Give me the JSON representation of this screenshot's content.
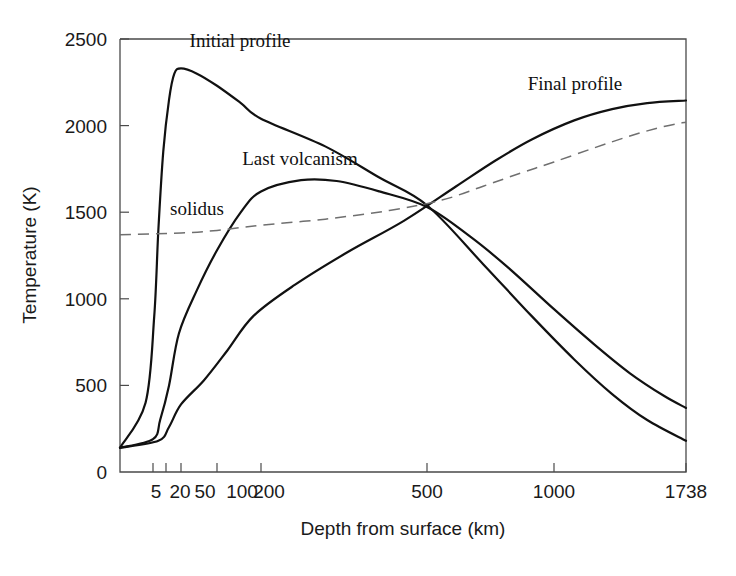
{
  "chart_data": {
    "type": "line",
    "title": "",
    "xlabel": "Depth from surface (km)",
    "ylabel": "Temperature (K)",
    "x_scale": "nonlinear-depth",
    "xlim": [
      0,
      1738
    ],
    "ylim": [
      0,
      2500
    ],
    "grid": false,
    "legend": "inline-annotations",
    "xticks": [
      5,
      20,
      50,
      100,
      200,
      500,
      1000,
      1738
    ],
    "xtick_labels": [
      "5",
      "20",
      "50",
      "100",
      "200",
      "500",
      "1000",
      "1738"
    ],
    "yticks": [
      0,
      500,
      1000,
      1500,
      2000,
      2500
    ],
    "ytick_labels": [
      "0",
      "500",
      "1000",
      "1500",
      "2000",
      "2500"
    ],
    "annotations": [
      {
        "text": "Initial profile",
        "x_px": 240,
        "y_px": 47
      },
      {
        "text": "Last volcanism",
        "x_px": 300,
        "y_px": 165
      },
      {
        "text": "solidus",
        "x_px": 197,
        "y_px": 215
      },
      {
        "text": "Final profile",
        "x_px": 575,
        "y_px": 90
      }
    ],
    "series": [
      {
        "name": "Initial profile",
        "style": "solid",
        "color": "#111111",
        "points": [
          [
            0,
            140
          ],
          [
            3,
            400
          ],
          [
            6,
            900
          ],
          [
            10,
            1400
          ],
          [
            16,
            1850
          ],
          [
            25,
            2150
          ],
          [
            35,
            2300
          ],
          [
            50,
            2330
          ],
          [
            70,
            2300
          ],
          [
            100,
            2230
          ],
          [
            150,
            2130
          ],
          [
            200,
            2040
          ],
          [
            300,
            1880
          ],
          [
            400,
            1700
          ],
          [
            500,
            1540
          ],
          [
            700,
            1200
          ],
          [
            900,
            900
          ],
          [
            1100,
            650
          ],
          [
            1300,
            450
          ],
          [
            1500,
            300
          ],
          [
            1738,
            180
          ]
        ]
      },
      {
        "name": "Last volcanism",
        "style": "solid",
        "color": "#111111",
        "points": [
          [
            0,
            140
          ],
          [
            5,
            190
          ],
          [
            12,
            300
          ],
          [
            25,
            500
          ],
          [
            45,
            800
          ],
          [
            70,
            1050
          ],
          [
            100,
            1280
          ],
          [
            150,
            1500
          ],
          [
            200,
            1620
          ],
          [
            260,
            1685
          ],
          [
            320,
            1680
          ],
          [
            400,
            1620
          ],
          [
            500,
            1530
          ],
          [
            650,
            1360
          ],
          [
            800,
            1180
          ],
          [
            1000,
            940
          ],
          [
            1200,
            740
          ],
          [
            1400,
            570
          ],
          [
            1600,
            440
          ],
          [
            1738,
            370
          ]
        ]
      },
      {
        "name": "Final profile",
        "style": "solid",
        "color": "#111111",
        "points": [
          [
            0,
            140
          ],
          [
            10,
            180
          ],
          [
            25,
            260
          ],
          [
            50,
            390
          ],
          [
            80,
            530
          ],
          [
            120,
            700
          ],
          [
            180,
            900
          ],
          [
            250,
            1080
          ],
          [
            340,
            1270
          ],
          [
            450,
            1450
          ],
          [
            600,
            1650
          ],
          [
            750,
            1800
          ],
          [
            900,
            1920
          ],
          [
            1100,
            2030
          ],
          [
            1300,
            2095
          ],
          [
            1500,
            2130
          ],
          [
            1738,
            2145
          ]
        ]
      },
      {
        "name": "solidus",
        "style": "dashed",
        "color": "#6f6f6f",
        "points": [
          [
            0,
            1370
          ],
          [
            50,
            1380
          ],
          [
            100,
            1395
          ],
          [
            200,
            1425
          ],
          [
            300,
            1460
          ],
          [
            420,
            1510
          ],
          [
            550,
            1570
          ],
          [
            700,
            1650
          ],
          [
            850,
            1725
          ],
          [
            1000,
            1790
          ],
          [
            1200,
            1870
          ],
          [
            1400,
            1940
          ],
          [
            1600,
            1995
          ],
          [
            1738,
            2020
          ]
        ]
      }
    ]
  },
  "axes": {
    "x_title": "Depth from surface (km)",
    "y_title": "Temperature (K)"
  }
}
